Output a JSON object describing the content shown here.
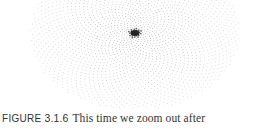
{
  "figure": {
    "center": [
      135,
      33
    ],
    "point_color": "#555555"
  },
  "caption": {
    "label": "FIGURE",
    "number": "3.1.6",
    "text": "This time we zoom out after"
  }
}
